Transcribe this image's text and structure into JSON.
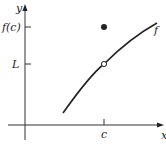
{
  "diagram": {
    "axes": {
      "x_label": "x",
      "y_label": "y"
    },
    "y_ticks": [
      {
        "label": "f(c)",
        "y": 27
      },
      {
        "label": "L",
        "y": 64
      }
    ],
    "x_ticks": [
      {
        "label": "c",
        "x": 104
      }
    ],
    "curve_label": "f",
    "points": {
      "filled": {
        "meaning": "f(c)",
        "x": 104,
        "y": 27
      },
      "open": {
        "meaning": "L",
        "x": 104,
        "y": 64
      }
    },
    "colors": {
      "ink": "#222222",
      "background": "#ffffff"
    }
  }
}
